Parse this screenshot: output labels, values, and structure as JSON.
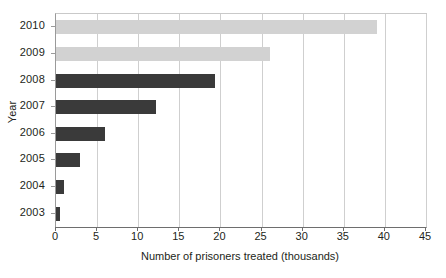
{
  "chart_data": {
    "type": "bar",
    "orientation": "horizontal",
    "title": "",
    "xlabel": "Number of prisoners treated (thousands)",
    "ylabel": "Year",
    "categories": [
      "2010",
      "2009",
      "2008",
      "2007",
      "2006",
      "2005",
      "2004",
      "2003"
    ],
    "values": [
      39,
      26,
      19.3,
      12.2,
      5.9,
      2.9,
      1.0,
      0.5
    ],
    "bar_colors": [
      "#d2d2d2",
      "#d2d2d2",
      "#3a3a3a",
      "#3a3a3a",
      "#3a3a3a",
      "#3a3a3a",
      "#3a3a3a",
      "#3a3a3a"
    ],
    "xlim": [
      0,
      45
    ],
    "xticks": [
      0,
      5,
      10,
      15,
      20,
      25,
      30,
      35,
      40,
      45
    ],
    "xtick_labels": [
      "0",
      "5",
      "10",
      "15",
      "20",
      "25",
      "30",
      "35",
      "40",
      "45"
    ],
    "grid": "vertical",
    "legend": null,
    "series": [
      {
        "name": "Number of prisoners treated (thousands)",
        "values": [
          39,
          26,
          19.3,
          12.2,
          5.9,
          2.9,
          1.0,
          0.5
        ]
      }
    ]
  },
  "colors": {
    "bar_light": "#d2d2d2",
    "bar_dark": "#3a3a3a",
    "grid": "#cfcfcf",
    "axis": "#6e6e6e",
    "text": "#231f20",
    "background": "#ffffff"
  }
}
